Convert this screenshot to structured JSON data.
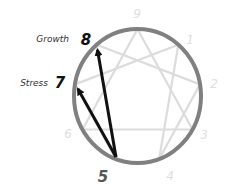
{
  "diagram": {
    "type_point": "5",
    "labels": {
      "growth": "Growth",
      "stress": "Stress"
    },
    "highlighted": {
      "growth_point": "8",
      "stress_point": "7",
      "origin_point": "5"
    },
    "faint_points": [
      "9",
      "1",
      "2",
      "3",
      "4",
      "6"
    ],
    "points": {
      "9": "9",
      "1": "1",
      "2": "2",
      "3": "3",
      "4": "4",
      "5": "5",
      "6": "6",
      "7": "7",
      "8": "8"
    },
    "colors": {
      "circle": "#808080",
      "inner_lines": "#dcdcdc",
      "faint_numbers": "#e0e0e0",
      "arrows": "#111111",
      "highlight_numbers": "#111111",
      "origin_number": "#555555",
      "label_text": "#333333"
    }
  }
}
